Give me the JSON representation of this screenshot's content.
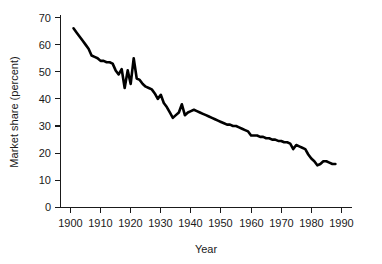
{
  "chart_data": {
    "type": "line",
    "title": "",
    "xlabel": "Year",
    "ylabel": "Market share (percent)",
    "xlim": [
      1896,
      1993
    ],
    "ylim": [
      0,
      70
    ],
    "xticks": [
      1900,
      1910,
      1920,
      1930,
      1940,
      1950,
      1960,
      1970,
      1980,
      1990
    ],
    "yticks": [
      0,
      10,
      20,
      30,
      40,
      50,
      60,
      70
    ],
    "grid": false,
    "legend": null,
    "series": [
      {
        "name": "Market share",
        "x": [
          1901,
          1902,
          1903,
          1904,
          1905,
          1906,
          1907,
          1908,
          1909,
          1910,
          1911,
          1912,
          1913,
          1914,
          1915,
          1916,
          1917,
          1918,
          1919,
          1920,
          1921,
          1922,
          1923,
          1924,
          1925,
          1926,
          1927,
          1928,
          1929,
          1930,
          1931,
          1932,
          1933,
          1934,
          1935,
          1936,
          1937,
          1938,
          1939,
          1940,
          1941,
          1942,
          1943,
          1944,
          1945,
          1946,
          1947,
          1948,
          1949,
          1950,
          1951,
          1952,
          1953,
          1954,
          1955,
          1956,
          1957,
          1958,
          1959,
          1960,
          1961,
          1962,
          1963,
          1964,
          1965,
          1966,
          1967,
          1968,
          1969,
          1970,
          1971,
          1972,
          1973,
          1974,
          1975,
          1976,
          1977,
          1978,
          1979,
          1980,
          1981,
          1982,
          1983,
          1984,
          1985,
          1986,
          1987,
          1988
        ],
        "values": [
          66.0,
          64.5,
          63.0,
          61.5,
          60.0,
          58.5,
          56.0,
          55.5,
          55.0,
          54.0,
          54.0,
          53.5,
          53.5,
          53.0,
          50.5,
          49.0,
          51.0,
          44.0,
          50.5,
          45.5,
          55.0,
          47.5,
          47.0,
          45.5,
          44.5,
          44.0,
          43.5,
          42.0,
          40.0,
          41.5,
          38.5,
          37.0,
          35.0,
          33.0,
          34.0,
          35.0,
          38.0,
          34.0,
          35.0,
          35.5,
          36.0,
          35.5,
          35.0,
          34.5,
          34.0,
          33.5,
          33.0,
          32.5,
          32.0,
          31.5,
          31.0,
          30.5,
          30.5,
          30.0,
          30.0,
          29.5,
          29.0,
          28.5,
          28.0,
          26.5,
          26.5,
          26.5,
          26.0,
          26.0,
          25.5,
          25.5,
          25.0,
          25.0,
          24.5,
          24.5,
          24.0,
          24.0,
          23.5,
          21.5,
          23.0,
          22.5,
          22.0,
          21.5,
          19.5,
          18.0,
          17.0,
          15.5,
          16.0,
          17.0,
          17.0,
          16.5,
          16.0,
          16.0
        ]
      }
    ]
  },
  "axes": {
    "x_title": "Year",
    "y_title": "Market share (percent)",
    "x_tick_labels": [
      "1900",
      "1910",
      "1920",
      "1930",
      "1940",
      "1950",
      "1960",
      "1970",
      "1980",
      "1990"
    ],
    "y_tick_labels": [
      "0",
      "10",
      "20",
      "30",
      "40",
      "50",
      "60",
      "70"
    ]
  },
  "colors": {
    "line": "#000000",
    "axis": "#1a1a1a",
    "background": "#ffffff"
  }
}
